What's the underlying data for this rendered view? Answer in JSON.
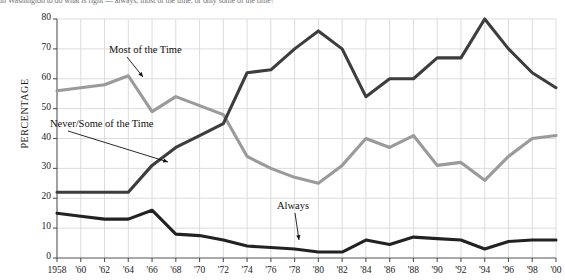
{
  "figure": {
    "caption_top": "in Washington to do what is right — always, most of the time, or only some of the time?",
    "y_axis_title": "PERCENTAGE"
  },
  "chart_data": {
    "type": "line",
    "title": "",
    "subtitle": "",
    "xlabel": "",
    "ylabel": "PERCENTAGE",
    "ylim": [
      0,
      80
    ],
    "xlim": [
      1958,
      2000
    ],
    "grid": true,
    "legend": "annotated-inline",
    "y_ticks": [
      0,
      10,
      20,
      30,
      40,
      50,
      60,
      70,
      80
    ],
    "x_ticks": [
      1958,
      1960,
      1962,
      1964,
      1966,
      1968,
      1970,
      1972,
      1974,
      1976,
      1978,
      1980,
      1982,
      1984,
      1986,
      1988,
      1990,
      1992,
      1994,
      1996,
      1998,
      2000
    ],
    "x_tick_labels": [
      "1958",
      "'60",
      "'62",
      "'64",
      "'66",
      "'68",
      "'70",
      "'72",
      "'74",
      "'76",
      "'78",
      "'80",
      "'82",
      "'84",
      "'86",
      "'88",
      "'90",
      "'92",
      "'94",
      "'96",
      "'98",
      "'00"
    ],
    "x": [
      1958,
      1960,
      1962,
      1964,
      1966,
      1968,
      1970,
      1972,
      1974,
      1976,
      1978,
      1980,
      1982,
      1984,
      1986,
      1988,
      1990,
      1992,
      1994,
      1996,
      1998,
      2000
    ],
    "series": [
      {
        "name": "Most of the Time",
        "color": "#9a9a9a",
        "values": [
          56,
          57,
          58,
          61,
          49,
          54,
          51,
          48,
          34,
          30,
          27,
          25,
          31,
          40,
          37,
          41,
          31,
          32,
          26,
          34,
          40,
          41
        ]
      },
      {
        "name": "Never/Some of the Time",
        "color": "#3d3d3d",
        "values": [
          22,
          22,
          22,
          22,
          31,
          37,
          41,
          45,
          62,
          63,
          70,
          76,
          70,
          54,
          60,
          60,
          67,
          67,
          80,
          70,
          62,
          57
        ]
      },
      {
        "name": "Always",
        "color": "#222222",
        "values": [
          15,
          14,
          13,
          13,
          16,
          8,
          7.5,
          6,
          4,
          3.5,
          3,
          2,
          2,
          6,
          4.5,
          7,
          6.5,
          6,
          3,
          5.5,
          6,
          6
        ]
      }
    ],
    "annotations": [
      {
        "text": "Most of the Time",
        "series": "Most of the Time",
        "label_x": 109,
        "label_y": 44
      },
      {
        "text": "Never/Some of the Time",
        "series": "Never/Some of the Time",
        "label_x": 50,
        "label_y": 118
      },
      {
        "text": "Always",
        "series": "Always",
        "label_x": 277,
        "label_y": 200
      }
    ]
  }
}
